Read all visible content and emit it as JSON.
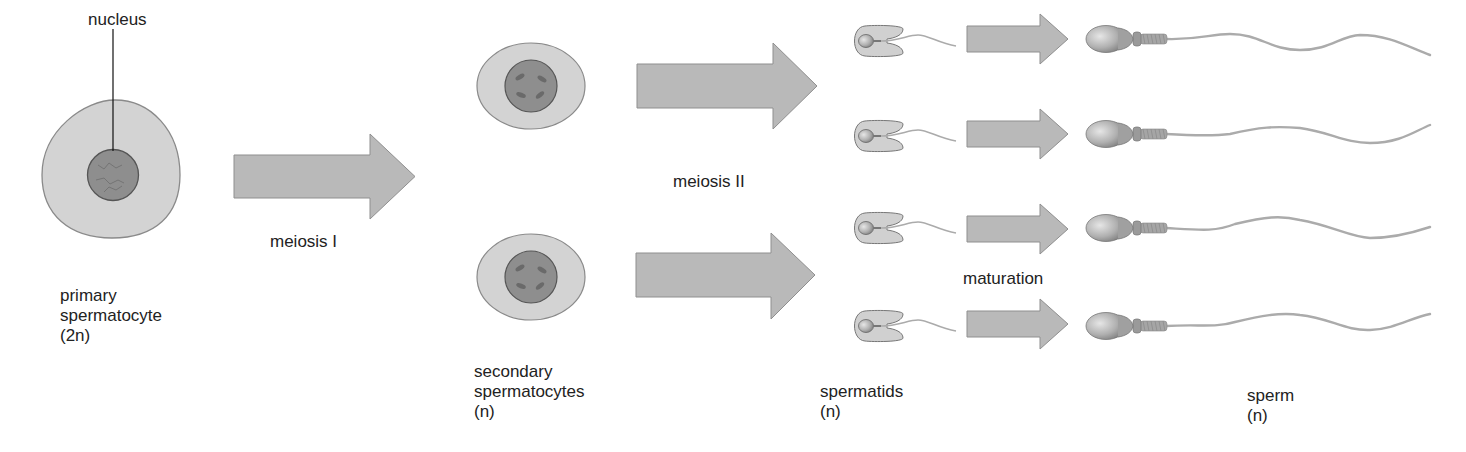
{
  "diagram": {
    "colors": {
      "cytoplasm": "#d3d3d3",
      "cell_outline": "#8a8a8a",
      "nucleus": "#8e8e8e",
      "nucleus_outline": "#555555",
      "chromosome": "#6a6a6a",
      "arrow": "#b9b9b9",
      "arrow_outline": "#8f8f8f",
      "sperm_head": "#a8a8a8",
      "tail": "#ababab",
      "text": "#222222"
    },
    "labels": {
      "nucleus": "nucleus",
      "primary": [
        "primary",
        "spermatocyte",
        "(2n)"
      ],
      "meiosis1": "meiosis I",
      "secondary": [
        "secondary",
        "spermatocytes",
        "(n)"
      ],
      "meiosis2": "meiosis II",
      "spermatids": [
        "spermatids",
        "(n)"
      ],
      "maturation": "maturation",
      "sperm": [
        "sperm",
        "(n)"
      ]
    },
    "stages": [
      {
        "name": "primary spermatocyte",
        "ploidy": "2n",
        "count": 1
      },
      {
        "name": "secondary spermatocytes",
        "ploidy": "n",
        "count": 2
      },
      {
        "name": "spermatids",
        "ploidy": "n",
        "count": 4
      },
      {
        "name": "sperm",
        "ploidy": "n",
        "count": 4
      }
    ],
    "processes": [
      {
        "name": "meiosis I",
        "from": "primary spermatocyte",
        "to": "secondary spermatocytes"
      },
      {
        "name": "meiosis II",
        "from": "secondary spermatocytes",
        "to": "spermatids"
      },
      {
        "name": "maturation",
        "from": "spermatids",
        "to": "sperm"
      }
    ]
  }
}
